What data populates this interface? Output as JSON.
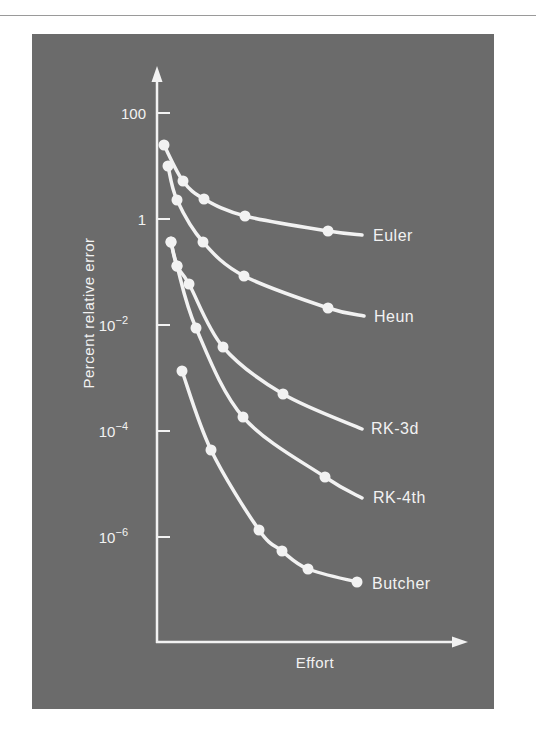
{
  "chart_data": {
    "type": "line",
    "title": "",
    "xlabel": "Effort",
    "ylabel": "Percent relative error",
    "yscale": "log",
    "ylim": [
      1e-08,
      1000
    ],
    "y_ticks": [
      {
        "value": 100,
        "label": "100",
        "base": "100",
        "exp": ""
      },
      {
        "value": 1,
        "label": "1",
        "base": "1",
        "exp": ""
      },
      {
        "value": 0.01,
        "label": "10^-2",
        "base": "10",
        "exp": "−2"
      },
      {
        "value": 0.0001,
        "label": "10^-4",
        "base": "10",
        "exp": "−4"
      },
      {
        "value": 1e-06,
        "label": "10^-6",
        "base": "10",
        "exp": "−6"
      }
    ],
    "x_ticks": [],
    "grid": false,
    "legend": "inline labels at right end of each curve",
    "series": [
      {
        "name": "Euler",
        "effort": [
          0.02,
          0.09,
          0.16,
          0.29,
          0.56,
          0.67
        ],
        "values": [
          25,
          5.2,
          2.4,
          1.15,
          0.6,
          0.5
        ],
        "px": [
          [
            164,
            145
          ],
          [
            183,
            181
          ],
          [
            204,
            199
          ],
          [
            245,
            216
          ],
          [
            328,
            231
          ],
          [
            362,
            235
          ]
        ],
        "label_pos": [
          373,
          241
        ],
        "end_marker": false
      },
      {
        "name": "Heun",
        "effort": [
          0.04,
          0.07,
          0.15,
          0.28,
          0.56,
          0.68
        ],
        "values": [
          10,
          2.3,
          0.37,
          0.08,
          0.021,
          0.015
        ],
        "px": [
          [
            168,
            166
          ],
          [
            177,
            200
          ],
          [
            203,
            242
          ],
          [
            244,
            276
          ],
          [
            328,
            308
          ],
          [
            364,
            316
          ]
        ],
        "label_pos": [
          374,
          322
        ],
        "end_marker": false
      },
      {
        "name": "RK-3d",
        "effort": [
          0.05,
          0.07,
          0.1,
          0.21,
          0.4,
          0.67
        ],
        "values": [
          0.37,
          0.13,
          0.06,
          0.004,
          0.0005,
          0.00011
        ],
        "px": [
          [
            171,
            242
          ],
          [
            177,
            266
          ],
          [
            189,
            284
          ],
          [
            223,
            347
          ],
          [
            283,
            394
          ],
          [
            362,
            429
          ]
        ],
        "label_pos": [
          371,
          434
        ],
        "end_marker": false
      },
      {
        "name": "RK-4th",
        "effort": [
          0.05,
          0.07,
          0.13,
          0.28,
          0.55,
          0.67
        ],
        "values": [
          0.37,
          0.13,
          0.009,
          0.00018,
          1.3e-05,
          5.5e-06
        ],
        "px": [
          [
            171,
            242
          ],
          [
            177,
            266
          ],
          [
            196,
            328
          ],
          [
            243,
            417
          ],
          [
            325,
            477
          ],
          [
            362,
            498
          ]
        ],
        "label_pos": [
          373,
          503
        ],
        "end_marker": false
      },
      {
        "name": "Butcher",
        "effort": [
          0.08,
          0.17,
          0.33,
          0.41,
          0.49,
          0.64
        ],
        "values": [
          0.0013,
          4.4e-05,
          1.3e-06,
          5.5e-07,
          2.5e-07,
          1.4e-07
        ],
        "px": [
          [
            182,
            371
          ],
          [
            211,
            450
          ],
          [
            259,
            530
          ],
          [
            282,
            551
          ],
          [
            308,
            569
          ],
          [
            357,
            582
          ]
        ],
        "label_pos": [
          372,
          589
        ],
        "end_marker": true
      }
    ]
  },
  "colors": {
    "panel_background": "#6b6b6b",
    "foreground": "#f2f2f2",
    "page_background": "#ffffff"
  }
}
